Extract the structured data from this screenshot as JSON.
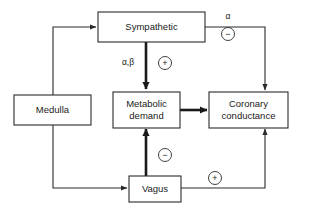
{
  "diagram": {
    "background_color": "#ffffff",
    "line_color": "#2b2b2b",
    "text_color": "#1a1a1a"
  },
  "nodes": [
    {
      "id": "medulla",
      "label": "Medulla",
      "label_line2": ""
    },
    {
      "id": "sympathetic",
      "label": "Sympathetic",
      "label_line2": ""
    },
    {
      "id": "metabolic",
      "label": "Metabolic",
      "label_line2": "demand"
    },
    {
      "id": "coronary",
      "label": "Coronary",
      "label_line2": "conductance"
    },
    {
      "id": "vagus",
      "label": "Vagus",
      "label_line2": ""
    }
  ],
  "edges": [
    {
      "id": "medulla-to-sympathetic",
      "from": "medulla",
      "to": "sympathetic",
      "label": "",
      "sign": "",
      "weight": "thin"
    },
    {
      "id": "medulla-to-vagus",
      "from": "medulla",
      "to": "vagus",
      "label": "",
      "sign": "",
      "weight": "thin"
    },
    {
      "id": "sympathetic-to-metabolic",
      "from": "sympathetic",
      "to": "metabolic",
      "label": "α,β",
      "sign": "+",
      "weight": "thick"
    },
    {
      "id": "sympathetic-to-coronary",
      "from": "sympathetic",
      "to": "coronary",
      "label": "α",
      "sign": "−",
      "weight": "thin"
    },
    {
      "id": "metabolic-to-coronary",
      "from": "metabolic",
      "to": "coronary",
      "label": "",
      "sign": "",
      "weight": "thick"
    },
    {
      "id": "vagus-to-metabolic",
      "from": "vagus",
      "to": "metabolic",
      "label": "",
      "sign": "−",
      "weight": "thick"
    },
    {
      "id": "vagus-to-coronary",
      "from": "vagus",
      "to": "coronary",
      "label": "",
      "sign": "+",
      "weight": "thin"
    }
  ],
  "labels": {
    "alpha": "α",
    "alpha_beta": "α,β",
    "plus": "+",
    "minus": "−"
  }
}
